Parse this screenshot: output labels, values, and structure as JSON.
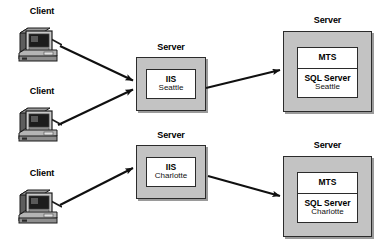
{
  "diagram": {
    "colors": {
      "server_fill": "#c3c3c3",
      "panel_fill": "#ffffff",
      "stroke": "#2b2b2b",
      "arrow": "#101010",
      "background": "#ffffff"
    },
    "clients": [
      {
        "id": "client-1",
        "label": "Client",
        "icon": "desktop-computer-icon"
      },
      {
        "id": "client-2",
        "label": "Client",
        "icon": "desktop-computer-icon"
      },
      {
        "id": "client-3",
        "label": "Client",
        "icon": "desktop-computer-icon"
      }
    ],
    "servers": [
      {
        "id": "web-server-seattle",
        "label": "Server",
        "panels": [
          {
            "title": "IIS",
            "subtitle": "Seattle"
          }
        ]
      },
      {
        "id": "data-server-seattle",
        "label": "Server",
        "panels": [
          {
            "title": "MTS",
            "subtitle": ""
          },
          {
            "title": "SQL Server",
            "subtitle": "Seattle"
          }
        ]
      },
      {
        "id": "web-server-charlotte",
        "label": "Server",
        "panels": [
          {
            "title": "IIS",
            "subtitle": "Charlotte"
          }
        ]
      },
      {
        "id": "data-server-charlotte",
        "label": "Server",
        "panels": [
          {
            "title": "MTS",
            "subtitle": ""
          },
          {
            "title": "SQL Server",
            "subtitle": "Charlotte"
          }
        ]
      }
    ],
    "connections": [
      {
        "id": "conn-client1-iis-seattle",
        "from": "client-1",
        "to": "web-server-seattle"
      },
      {
        "id": "conn-client2-iis-seattle",
        "from": "client-2",
        "to": "web-server-seattle"
      },
      {
        "id": "conn-iis-sql-seattle",
        "from": "web-server-seattle",
        "to": "data-server-seattle"
      },
      {
        "id": "conn-client3-iis-charlotte",
        "from": "client-3",
        "to": "web-server-charlotte"
      },
      {
        "id": "conn-iis-sql-charlotte",
        "from": "web-server-charlotte",
        "to": "data-server-charlotte"
      }
    ]
  }
}
